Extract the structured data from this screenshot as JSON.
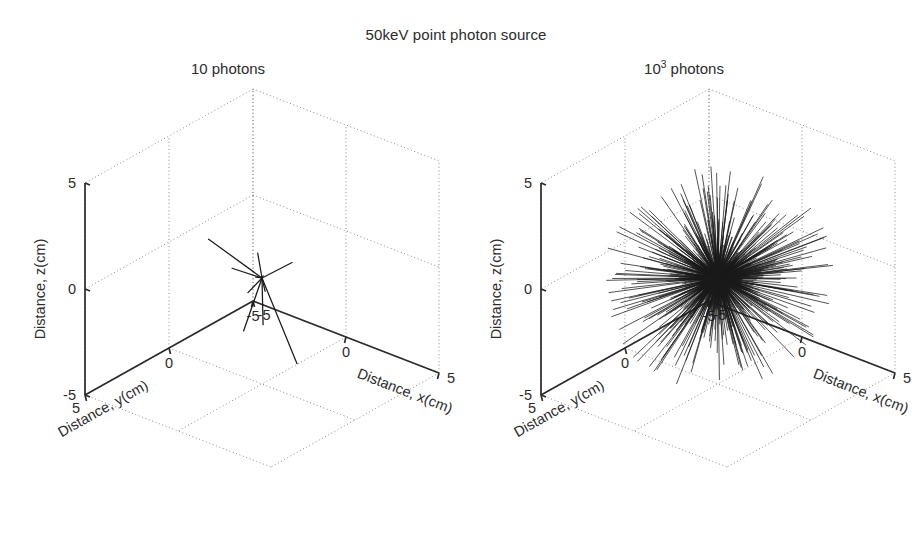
{
  "figure": {
    "title": "50keV point photon source",
    "width": 912,
    "height": 544,
    "background": "#ffffff",
    "ink_color": "#2b2b2b",
    "grid_color": "#8c8c8c",
    "track_color": "#1a1a1a"
  },
  "chart_data": {
    "type": "scatter",
    "title": "50keV point photon source",
    "projection": "3d",
    "panels": [
      {
        "id": "left",
        "title": "10 photons",
        "photon_count": 10,
        "source_position": [
          0,
          0,
          0
        ],
        "xlabel": "Distance, x(cm)",
        "ylabel": "Distance, y(cm)",
        "zlabel": "Distance, z(cm)",
        "xlim": [
          -5,
          5
        ],
        "ylim": [
          -5,
          5
        ],
        "zlim": [
          -5,
          5
        ],
        "xticks": [
          -5,
          0,
          5
        ],
        "yticks": [
          -5,
          0,
          5
        ],
        "zticks": [
          -5,
          0,
          5
        ],
        "xticklabels": [
          "-5",
          "0",
          "5"
        ],
        "yticklabels": [
          "5",
          "0",
          "-5"
        ],
        "zticklabels": [
          "5",
          "0",
          "-5"
        ],
        "grid": true,
        "legend": "none",
        "tracks": [
          {
            "dir": [
              0.72,
              0.3,
              0.58
            ],
            "length": 3.6
          },
          {
            "dir": [
              -0.88,
              -0.16,
              0.1
            ],
            "length": 3.9
          },
          {
            "dir": [
              -0.62,
              0.36,
              0.22
            ],
            "length": 1.7
          },
          {
            "dir": [
              0.6,
              0.52,
              -0.05
            ],
            "length": 1.3
          },
          {
            "dir": [
              -0.3,
              -0.1,
              0.92
            ],
            "length": 1.1
          },
          {
            "dir": [
              -0.52,
              0.12,
              -0.7
            ],
            "length": 1.2
          },
          {
            "dir": [
              0.1,
              0.08,
              -0.98
            ],
            "length": 2.1
          },
          {
            "dir": [
              0.34,
              -0.12,
              -0.9
            ],
            "length": 4.2
          },
          {
            "dir": [
              -0.2,
              0.2,
              -0.94
            ],
            "length": 2.6
          },
          {
            "dir": [
              0.45,
              0.42,
              0.45
            ],
            "length": 0.9
          },
          {
            "dir": [
              -0.74,
              -0.44,
              -0.4
            ],
            "length": 1.0
          }
        ]
      },
      {
        "id": "right",
        "title": "10^3 photons",
        "title_mantissa": "10",
        "title_exponent": "3",
        "title_suffix": " photons",
        "photon_count": 1000,
        "source_position": [
          0,
          0,
          0
        ],
        "xlabel": "Distance, x(cm)",
        "ylabel": "Distance, y(cm)",
        "zlabel": "Distance, z(cm)",
        "xlim": [
          -5,
          5
        ],
        "ylim": [
          -5,
          5
        ],
        "zlim": [
          -5,
          5
        ],
        "xticks": [
          -5,
          0,
          5
        ],
        "yticks": [
          -5,
          0,
          5
        ],
        "zticks": [
          -5,
          0,
          5
        ],
        "xticklabels": [
          "-5",
          "0",
          "5"
        ],
        "yticklabels": [
          "5",
          "0",
          "-5"
        ],
        "zticklabels": [
          "5",
          "0",
          "-5"
        ],
        "grid": true,
        "legend": "none",
        "distribution": "isotropic",
        "mean_track_length": 2.6,
        "track_count": 1000
      }
    ]
  },
  "axis_labels": {
    "x": "Distance, x(cm)",
    "y": "Distance, y(cm)",
    "z": "Distance, z(cm)"
  },
  "tick_values": {
    "z_top": "5",
    "z_mid": "0",
    "z_bottom": "−5",
    "y_near_origin_corner": "5",
    "y_mid": "0",
    "y_far": "−5",
    "x_near": "−5",
    "x_mid": "0",
    "x_far": "5"
  },
  "panel_titles": {
    "left": "10 photons",
    "right_mantissa": "10",
    "right_exponent": "3",
    "right_suffix": " photons"
  }
}
